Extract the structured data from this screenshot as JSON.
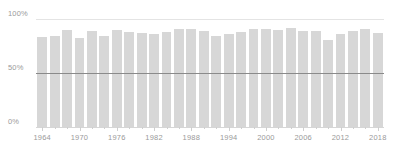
{
  "chart_data": {
    "type": "bar",
    "title": "",
    "subtitle": "",
    "xlabel": "",
    "ylabel": "",
    "ylim": [
      0,
      100
    ],
    "yticks": [
      0,
      50,
      100
    ],
    "ytick_labels": [
      "0%",
      "50%",
      "100%"
    ],
    "grid": true,
    "gridlines_y": [
      0,
      100
    ],
    "reference_line_y": 50,
    "legend": null,
    "legend_position": "none",
    "xtick_labels": [
      "1964",
      "1970",
      "1976",
      "1982",
      "1988",
      "1994",
      "2000",
      "2006",
      "2012",
      "2018"
    ],
    "categories": [
      "1964",
      "1966",
      "1968",
      "1970",
      "1972",
      "1974",
      "1976",
      "1978",
      "1980",
      "1982",
      "1984",
      "1986",
      "1988",
      "1990",
      "1992",
      "1994",
      "1996",
      "1998",
      "2000",
      "2002",
      "2004",
      "2006",
      "2008",
      "2010",
      "2012",
      "2014",
      "2016",
      "2018"
    ],
    "values": [
      83,
      84,
      90,
      82,
      89,
      84,
      90,
      88,
      87,
      86,
      88,
      91,
      91,
      89,
      84,
      86,
      88,
      91,
      91,
      90,
      92,
      89,
      89,
      81,
      86,
      89,
      91,
      87
    ],
    "bar_color": "#d7d7d7",
    "axis_text_color": "#9a9a9a",
    "gridline_color": "#e4e4e4",
    "reference_line_color": "#8a8a8a",
    "background_color": "#ffffff"
  },
  "axis": {
    "y": {
      "label_100": "100%",
      "label_50": "50%",
      "label_0": "0%"
    }
  }
}
